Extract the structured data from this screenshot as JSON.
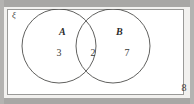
{
  "figure": {
    "type": "venn-diagram",
    "universal_set_symbol": "ξ",
    "outside_count": "8",
    "sets": [
      {
        "id": "A",
        "label": "A",
        "exclusive_count": "3"
      },
      {
        "id": "B",
        "label": "B",
        "exclusive_count": "7"
      }
    ],
    "intersection_count": "2",
    "colors": {
      "page_background": "#f2f1ef",
      "box_background": "#ffffff",
      "box_border": "#9a9a98",
      "circle_stroke": "#4f4f4d",
      "text": "#2b2b2b",
      "number_text": "#3a3a38",
      "scan_strip": "#a8a7a5"
    },
    "geometry": {
      "circle_a": {
        "cx": 59,
        "cy": 45,
        "r": 37
      },
      "circle_b": {
        "cx": 113,
        "cy": 45,
        "r": 37
      }
    }
  }
}
